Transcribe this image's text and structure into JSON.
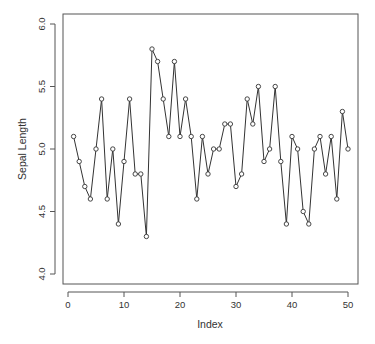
{
  "chart_data": {
    "type": "line",
    "title": "",
    "xlabel": "Index",
    "ylabel": "Sepal Length",
    "xlim": [
      0,
      50
    ],
    "ylim": [
      4.0,
      6.0
    ],
    "x_ticks": [
      "0",
      "10",
      "20",
      "30",
      "40",
      "50"
    ],
    "y_ticks": [
      "4.0",
      "4.5",
      "5.0",
      "5.5",
      "6.0"
    ],
    "grid": false,
    "legend": null,
    "marker": "open-circle",
    "series": [
      {
        "name": "Sepal Length",
        "x": [
          1,
          2,
          3,
          4,
          5,
          6,
          7,
          8,
          9,
          10,
          11,
          12,
          13,
          14,
          15,
          16,
          17,
          18,
          19,
          20,
          21,
          22,
          23,
          24,
          25,
          26,
          27,
          28,
          29,
          30,
          31,
          32,
          33,
          34,
          35,
          36,
          37,
          38,
          39,
          40,
          41,
          42,
          43,
          44,
          45,
          46,
          47,
          48,
          49,
          50
        ],
        "values": [
          5.1,
          4.9,
          4.7,
          4.6,
          5.0,
          5.4,
          4.6,
          5.0,
          4.4,
          4.9,
          5.4,
          4.8,
          4.8,
          4.3,
          5.8,
          5.7,
          5.4,
          5.1,
          5.7,
          5.1,
          5.4,
          5.1,
          4.6,
          5.1,
          4.8,
          5.0,
          5.0,
          5.2,
          5.2,
          4.7,
          4.8,
          5.4,
          5.2,
          5.5,
          4.9,
          5.0,
          5.5,
          4.9,
          4.4,
          5.1,
          5.0,
          4.5,
          4.4,
          5.0,
          5.1,
          4.8,
          5.1,
          4.6,
          5.3,
          5.0
        ]
      }
    ]
  }
}
